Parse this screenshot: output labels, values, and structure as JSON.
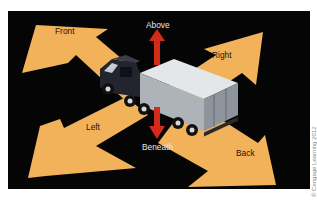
{
  "diagram": {
    "labels": {
      "front": "Front",
      "right": "Right",
      "left": "Left",
      "back": "Back",
      "above": "Above",
      "beneath": "Beneath"
    },
    "colors": {
      "background": "#050505",
      "arrow_fill": "#f2b25a",
      "vertical_arrow": "#d42a1a",
      "trailer": "#c9cdd2",
      "cab": "#22252e"
    },
    "copyright": "© Cengage Learning 2012"
  }
}
